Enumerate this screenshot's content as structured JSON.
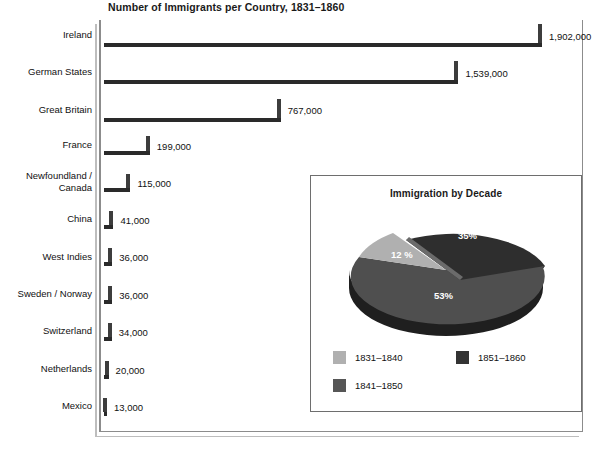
{
  "chart_data": [
    {
      "type": "bar",
      "title": "Number of Immigrants per Country, 1831–1860",
      "orientation": "horizontal",
      "xlabel": "",
      "ylabel": "",
      "grid": false,
      "legend": "none",
      "xlim": [
        0,
        2000000
      ],
      "categories": [
        "Ireland",
        "German States",
        "Great Britain",
        "France",
        "Newfoundland /\nCanada",
        "China",
        "West Indies",
        "Sweden / Norway",
        "Switzerland",
        "Netherlands",
        "Mexico"
      ],
      "values": [
        1902000,
        1539000,
        767000,
        199000,
        115000,
        41000,
        36000,
        36000,
        34000,
        20000,
        13000
      ],
      "value_labels": [
        "1,902,000",
        "1,539,000",
        "767,000",
        "199,000",
        "115,000",
        "41,000",
        "36,000",
        "36,000",
        "34,000",
        "20,000",
        "13,000"
      ],
      "bar_color": "#636363",
      "bar_shadow_color": "#2a2a2a"
    },
    {
      "type": "pie",
      "title": "Immigration by Decade",
      "labels": [
        "1831–1840",
        "1851–1860",
        "1841–1850"
      ],
      "slice_order": [
        "1851–1860",
        "1841–1850",
        "1831–1840"
      ],
      "values": [
        12,
        53,
        35
      ],
      "value_labels": [
        "12 %",
        "53%",
        "35%"
      ],
      "colors": [
        "#b3b3b3",
        "#333333",
        "#555555"
      ],
      "legend": "bottom",
      "exploded_slice": "1851–1860"
    }
  ],
  "bar_chart": {
    "title": "Number of Immigrants per Country, 1831–1860",
    "rows": [
      {
        "label": "Ireland",
        "value": "1,902,000"
      },
      {
        "label": "German States",
        "value": "1,539,000"
      },
      {
        "label": "Great Britain",
        "value": "767,000"
      },
      {
        "label": "France",
        "value": "199,000"
      },
      {
        "label": "Newfoundland /\nCanada",
        "value": "115,000"
      },
      {
        "label": "China",
        "value": "41,000"
      },
      {
        "label": "West Indies",
        "value": "36,000"
      },
      {
        "label": "Sweden / Norway",
        "value": "36,000"
      },
      {
        "label": "Switzerland",
        "value": "34,000"
      },
      {
        "label": "Netherlands",
        "value": "20,000"
      },
      {
        "label": "Mexico",
        "value": "13,000"
      }
    ]
  },
  "inset": {
    "title": "Immigration by Decade",
    "slices": [
      {
        "label": "35%"
      },
      {
        "label": "12 %"
      },
      {
        "label": "53%"
      }
    ],
    "legend": [
      {
        "label": "1831–1840",
        "color": "#b3b3b3"
      },
      {
        "label": "1851–1860",
        "color": "#333333"
      },
      {
        "label": "1841–1850",
        "color": "#555555"
      }
    ]
  },
  "footer": {
    "clipped_text": " "
  }
}
